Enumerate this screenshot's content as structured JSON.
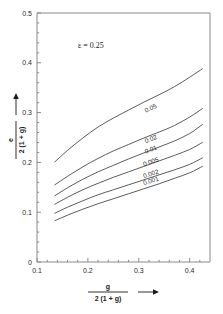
{
  "chart_data": {
    "type": "line",
    "title": "",
    "subtitle": "",
    "annotation": "ε = 0.25",
    "xlabel_numerator": "g",
    "xlabel_denominator": "2 (1 + g)",
    "ylabel_numerator": "e",
    "ylabel_denominator": "2 (1 + g)",
    "xlim": [
      0.1,
      0.44
    ],
    "ylim": [
      0.0,
      0.5
    ],
    "xticks": [
      0.1,
      0.2,
      0.3,
      0.4
    ],
    "xticklabels": [
      "0.1",
      "0.2",
      "0.3",
      "0.4"
    ],
    "yticks": [
      0.0,
      0.1,
      0.2,
      0.3,
      0.4,
      0.5
    ],
    "yticklabels": [
      "0",
      "0.1",
      "0.2",
      "0.3",
      "0.4",
      "0.5"
    ],
    "grid": false,
    "legend_position": "inline-curve-labels",
    "x": [
      0.135,
      0.16,
      0.19,
      0.22,
      0.25,
      0.28,
      0.31,
      0.34,
      0.37,
      0.4,
      0.425
    ],
    "series": [
      {
        "name": "0.05",
        "label": "0.05",
        "label_x": 0.325,
        "label_y": 0.305,
        "values": [
          0.201,
          0.224,
          0.249,
          0.271,
          0.289,
          0.305,
          0.321,
          0.336,
          0.352,
          0.371,
          0.388
        ]
      },
      {
        "name": "0.02",
        "label": "0.02",
        "label_x": 0.325,
        "label_y": 0.243,
        "values": [
          0.155,
          0.172,
          0.191,
          0.208,
          0.223,
          0.236,
          0.249,
          0.261,
          0.274,
          0.291,
          0.308
        ]
      },
      {
        "name": "0.01",
        "label": "0.01",
        "label_x": 0.325,
        "label_y": 0.222,
        "values": [
          0.133,
          0.149,
          0.166,
          0.181,
          0.194,
          0.207,
          0.219,
          0.231,
          0.243,
          0.258,
          0.276
        ]
      },
      {
        "name": "0.005",
        "label": "0.005",
        "label_x": 0.325,
        "label_y": 0.197,
        "values": [
          0.116,
          0.13,
          0.145,
          0.158,
          0.17,
          0.181,
          0.192,
          0.203,
          0.214,
          0.226,
          0.24
        ]
      },
      {
        "name": "0.002",
        "label": "0.002",
        "label_x": 0.325,
        "label_y": 0.173,
        "values": [
          0.098,
          0.11,
          0.123,
          0.135,
          0.145,
          0.155,
          0.165,
          0.175,
          0.185,
          0.196,
          0.209
        ]
      },
      {
        "name": "0.001",
        "label": "0.001",
        "label_x": 0.325,
        "label_y": 0.159,
        "values": [
          0.083,
          0.094,
          0.106,
          0.117,
          0.127,
          0.137,
          0.147,
          0.157,
          0.168,
          0.179,
          0.192
        ]
      }
    ]
  },
  "colors": {
    "curve": "#4a4a4a",
    "axis": "#8a8a8a",
    "text": "#1a1a1a",
    "background": "#ffffff"
  }
}
